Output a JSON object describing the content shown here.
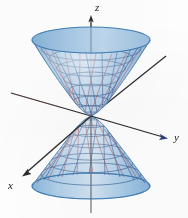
{
  "figure": {
    "kind": "3d-surface-plot",
    "name": "hyperboloid-of-one-sheet",
    "background_color": "#fdfdfd",
    "axes": {
      "z": {
        "label": "z",
        "label_x": 95,
        "label_y": 11,
        "direction": "up"
      },
      "y": {
        "label": "y",
        "label_x": 174,
        "label_y": 141,
        "direction": "right-down"
      },
      "x": {
        "label": "x",
        "label_x": 12,
        "label_y": 189,
        "direction": "left-down"
      },
      "axis_color": "#2b2b2b",
      "axis_width": 1.3
    },
    "surface": {
      "fill_outer": "#7aabd4",
      "fill_mid": "#9cc4e2",
      "fill_inner": "#cadef0",
      "fill_highlight": "#e4eff8",
      "rim_stroke": "#3f7eb5",
      "grid_circle_color": "#2f5f93",
      "ruling_color_a": "#3a4f8f",
      "ruling_color_b": "#a2565f",
      "opacity": 0.82
    },
    "geometry": {
      "center_x": 91,
      "top_rim_y": 40,
      "bottom_rim_y": 186,
      "waist_y": 116,
      "top_rim_rx": 59,
      "top_rim_ry": 13,
      "bottom_rim_rx": 59,
      "bottom_rim_ry": 13,
      "waist_rx": 15,
      "waist_ry": 4,
      "levels": 9,
      "meridians": 24
    }
  }
}
